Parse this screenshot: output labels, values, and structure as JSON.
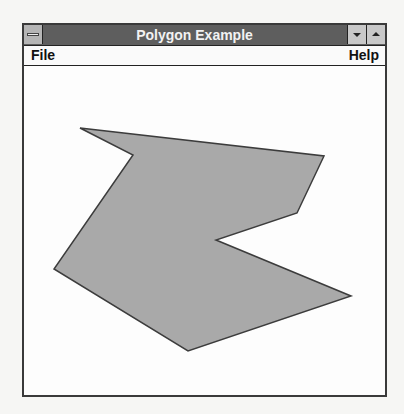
{
  "window": {
    "title": "Polygon Example",
    "system_menu_icon": "system-menu-icon",
    "minimize_icon": "minimize-icon",
    "maximize_icon": "maximize-icon"
  },
  "menubar": {
    "items": [
      {
        "label": "File"
      },
      {
        "label": "Help"
      }
    ]
  },
  "canvas": {
    "shape": "polygon",
    "fill": "#a9a9a9",
    "stroke": "#3c3c3c",
    "points": "80,126 324,154 297,211 216,238 351,294 188,349 54,267 133,153"
  }
}
